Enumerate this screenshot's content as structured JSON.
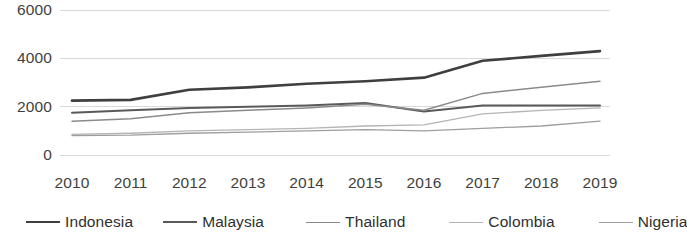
{
  "chart_data": {
    "type": "line",
    "title": "",
    "xlabel": "",
    "ylabel": "",
    "categories": [
      "2010",
      "2011",
      "2012",
      "2013",
      "2014",
      "2015",
      "2016",
      "2017",
      "2018",
      "2019"
    ],
    "ylim": [
      0,
      6000
    ],
    "y_ticks": [
      "0",
      "2000",
      "4000",
      "6000"
    ],
    "y_tick_values": [
      0,
      2000,
      4000,
      6000
    ],
    "grid": "horizontal",
    "legend_position": "bottom",
    "series": [
      {
        "name": "Indonesia",
        "color": "#3f3f3f",
        "width": 2.6,
        "dash": "none",
        "values": [
          2250,
          2280,
          2700,
          2800,
          2950,
          3050,
          3200,
          3900,
          4100,
          4300
        ]
      },
      {
        "name": "Malaysia",
        "color": "#5a5a5a",
        "width": 2.0,
        "dash": "none",
        "values": [
          1750,
          1850,
          1950,
          2000,
          2050,
          2150,
          1800,
          2050,
          2050,
          2050
        ]
      },
      {
        "name": "Thailand",
        "color": "#8a8a8a",
        "width": 1.5,
        "dash": "none",
        "values": [
          1400,
          1500,
          1750,
          1850,
          1950,
          2100,
          1850,
          2550,
          2800,
          3050
        ]
      },
      {
        "name": "Colombia",
        "color": "#b4b4b4",
        "width": 1.3,
        "dash": "none",
        "values": [
          850,
          900,
          1000,
          1050,
          1100,
          1200,
          1250,
          1700,
          1850,
          1950
        ]
      },
      {
        "name": "Nigeria",
        "color": "#9e9e9e",
        "width": 1.3,
        "dash": "none",
        "values": [
          800,
          820,
          900,
          950,
          1000,
          1050,
          1000,
          1100,
          1200,
          1400
        ]
      }
    ]
  },
  "legend": {
    "items": [
      {
        "label": "Indonesia"
      },
      {
        "label": "Malaysia"
      },
      {
        "label": "Thailand"
      },
      {
        "label": "Colombia"
      },
      {
        "label": "Nigeria"
      }
    ]
  },
  "style": {
    "grid_color": "#d9d9d9",
    "text_color": "#3f3f3f",
    "background": "#ffffff"
  }
}
